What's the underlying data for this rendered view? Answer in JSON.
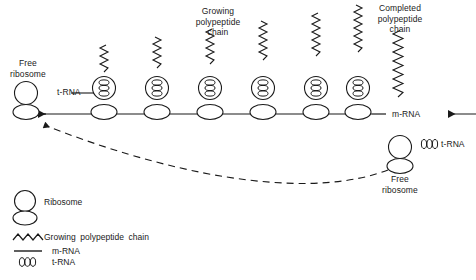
{
  "figure": {
    "title_labels": {
      "free_ribosome_left": "Free\nribosome",
      "trna_strand": "t-RNA",
      "growing_chain": "Growing\npolypeptide\nchain",
      "completed_chain": "Completed\npolypeptide\nchain",
      "mrna": "m-RNA",
      "trna_free": "t-RNA",
      "free_ribosome_right": "Free\nribosome"
    },
    "legend": [
      {
        "icon": "ribosome-icon",
        "label": "Ribosome"
      },
      {
        "icon": "zigzag-chain-icon",
        "label": "Growing  polypeptide  chain"
      },
      {
        "icon": "mrna-line-icon",
        "label": "m-RNA"
      },
      {
        "icon": "trna-beads-icon",
        "label": "t-RNA"
      }
    ],
    "caption": "",
    "colors": {
      "ink": "#1a1a1a",
      "background": "#ffffff"
    },
    "ribosome_count": 6,
    "chain_heights": [
      20,
      24,
      28,
      32,
      36,
      40
    ]
  }
}
